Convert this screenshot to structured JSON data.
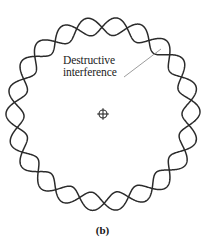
{
  "figure": {
    "caption": "(b)",
    "annotation": {
      "line1": "Destructive",
      "line2": "interference",
      "leader_from": [
        124,
        77
      ],
      "leader_to": [
        161,
        49
      ]
    },
    "center_marker": {
      "name": "nucleus-crosshair",
      "x": 103,
      "y": 114,
      "radius": 4
    },
    "colors": {
      "background": "#ffffff",
      "wave_stroke": "#2b2b2b",
      "text": "#1b1b1b",
      "leader_line": "#7a7a7a",
      "caption": "#141414"
    }
  },
  "chart_data": {
    "type": "line",
    "subtitle": "(b)",
    "xlabel": "",
    "ylabel": "",
    "coordinate_system": "polar",
    "grid": false,
    "legend": false,
    "center": [
      103,
      114
    ],
    "base_radius": 88,
    "amplitude": 9,
    "cycles": 11,
    "series": [
      {
        "name": "wave-a",
        "phase_deg": 0,
        "stroke": "#2b2b2b",
        "stroke_width": 1.5
      },
      {
        "name": "wave-b",
        "phase_deg": 196,
        "stroke": "#2b2b2b",
        "stroke_width": 1.5
      }
    ],
    "annotations": [
      {
        "text": "Destructive interference",
        "x": 63,
        "y": 54,
        "leader_from": [
          124,
          77
        ],
        "leader_to": [
          161,
          49
        ]
      }
    ]
  }
}
